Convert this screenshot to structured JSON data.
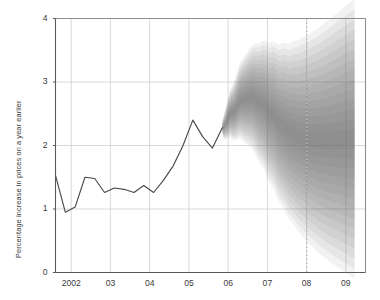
{
  "chart_data": {
    "type": "area",
    "title": "",
    "subtitle": "",
    "xlabel": "",
    "ylabel": "Percentage increase in prices on a year earlier",
    "ylim": [
      0,
      4
    ],
    "xlim": [
      2001.6,
      2009.5
    ],
    "yticks": [
      0,
      1,
      2,
      3,
      4
    ],
    "ytick_labels": [
      "0",
      "1",
      "2",
      "3",
      "4"
    ],
    "xticks": [
      2002,
      2003,
      2004,
      2005,
      2006,
      2007,
      2008,
      2009
    ],
    "xtick_labels": [
      "2002",
      "03",
      "04",
      "05",
      "06",
      "07",
      "08",
      "09"
    ],
    "grid": true,
    "grid_color": "#c9c9c9",
    "legend": null,
    "annotations": [
      {
        "name": "forecast-reference-line",
        "type": "vline",
        "x": 2008,
        "style": "dotted",
        "color": "#b9b9b9"
      }
    ],
    "series": [
      {
        "name": "History",
        "type": "line",
        "color": "#4a4a4a",
        "x": [
          2001.6,
          2001.85,
          2002.1,
          2002.35,
          2002.6,
          2002.85,
          2003.1,
          2003.35,
          2003.6,
          2003.85,
          2004.1,
          2004.35,
          2004.6,
          2004.85,
          2005.1,
          2005.35,
          2005.6,
          2005.85
        ],
        "values": [
          1.53,
          0.95,
          1.03,
          1.5,
          1.48,
          1.26,
          1.33,
          1.31,
          1.26,
          1.37,
          1.26,
          1.45,
          1.68,
          2.0,
          2.4,
          2.14,
          1.96,
          2.28
        ]
      },
      {
        "name": "Forecast fan (central projection)",
        "type": "line",
        "color": "#8a8a8a",
        "x": [
          2005.85,
          2006.1,
          2006.35,
          2006.6,
          2006.85,
          2007.1,
          2007.35,
          2007.6,
          2007.85,
          2008.1,
          2008.35,
          2008.6,
          2008.85,
          2009.1,
          2009.22
        ],
        "values": [
          2.28,
          2.52,
          2.72,
          2.76,
          2.66,
          2.5,
          2.33,
          2.21,
          2.14,
          2.1,
          2.08,
          2.08,
          2.09,
          2.1,
          2.1
        ]
      }
    ],
    "fan_bands": {
      "description": "Nested probability bands around the central projection, darkest at centre fading outwards",
      "n_bands": 14,
      "widest_band_at_start": 0.1,
      "widest_band_at_end": 2.2,
      "upper_bound_end": 3.15,
      "lower_bound_end": 0.95,
      "upper_bound_peak": 3.45,
      "lower_bound_peak": 1.95,
      "fan_start_x": 2005.85,
      "fan_end_x": 2009.22,
      "band_color": "#6d6d6d"
    }
  }
}
